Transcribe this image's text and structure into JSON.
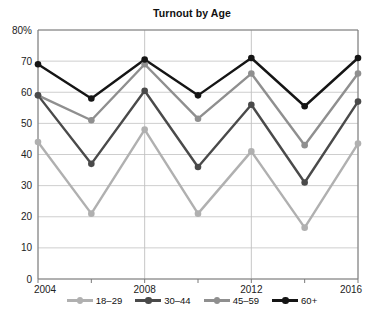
{
  "chart_data": {
    "type": "line",
    "title": "Turnout by Age",
    "xlabel": "",
    "ylabel": "",
    "x": [
      2004,
      2006,
      2008,
      2010,
      2012,
      2014,
      2016
    ],
    "xticks": [
      "2004",
      "2008",
      "2012",
      "2016"
    ],
    "xtick_values": [
      2004,
      2008,
      2012,
      2016
    ],
    "xlim": [
      2004,
      2016
    ],
    "ylim": [
      0,
      80
    ],
    "yticks": [
      "0",
      "10",
      "20",
      "30",
      "40",
      "50",
      "60",
      "70",
      "80%"
    ],
    "ytick_values": [
      0,
      10,
      20,
      30,
      40,
      50,
      60,
      70,
      80
    ],
    "grid": "horizontal-and-vertical",
    "legend_position": "bottom",
    "series": [
      {
        "name": "18–29",
        "color": "#b0b0b0",
        "values": [
          44,
          21,
          48,
          21,
          41,
          16.5,
          43.5
        ]
      },
      {
        "name": "30–44",
        "color": "#4a4a4a",
        "values": [
          59,
          37,
          60.5,
          36,
          56,
          31,
          57
        ]
      },
      {
        "name": "45–59",
        "color": "#8f8f8f",
        "values": [
          59,
          51,
          69,
          51.5,
          66,
          43,
          66
        ]
      },
      {
        "name": "60+",
        "color": "#151515",
        "values": [
          69,
          58,
          70.5,
          59,
          71,
          55.5,
          71
        ]
      }
    ]
  },
  "caption": ""
}
